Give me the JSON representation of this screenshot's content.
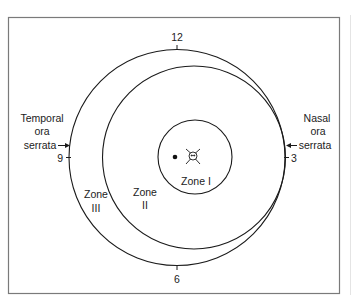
{
  "diagram": {
    "type": "retinopathy-of-prematurity-zones",
    "clock_hours": {
      "top": "12",
      "right": "3",
      "bottom": "6",
      "left": "9"
    },
    "left_label": {
      "line1": "Temporal",
      "line2": "ora",
      "line3": "serrata"
    },
    "right_label": {
      "line1": "Nasal",
      "line2": "ora",
      "line3": "serrata"
    },
    "zones": [
      {
        "name": "Zone I",
        "line1": "Zone I"
      },
      {
        "name": "Zone II",
        "line1": "Zone",
        "line2": "II"
      },
      {
        "name": "Zone III",
        "line1": "Zone",
        "line2": "III"
      }
    ],
    "colors": {
      "line": "#1a1a1a",
      "frame": "#7a7a7a",
      "background": "#ffffff"
    }
  }
}
